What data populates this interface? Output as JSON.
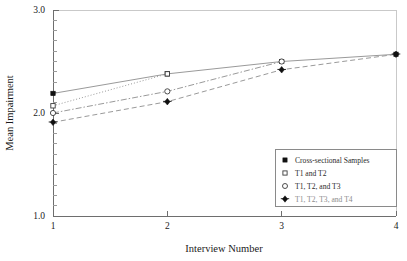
{
  "chart_data": {
    "type": "line",
    "title": "",
    "xlabel": "Interview Number",
    "ylabel": "Mean Impairment",
    "x": [
      1,
      2,
      3,
      4
    ],
    "xtick_labels": [
      "1",
      "2",
      "3",
      "4"
    ],
    "xlim": [
      1,
      4
    ],
    "ylim": [
      1.0,
      3.0
    ],
    "ytick_labels": [
      "3.0",
      "2.0",
      "1.0"
    ],
    "ytick_values": [
      3.0,
      2.0,
      1.0
    ],
    "yminor_step": 0.1,
    "grid": false,
    "legend_position": "lower right",
    "series": [
      {
        "name": "Cross-sectional Samples",
        "marker": "filled-square",
        "linestyle": "solid",
        "x": [
          1,
          2,
          3,
          4
        ],
        "values": [
          2.19,
          2.38,
          2.5,
          2.57
        ]
      },
      {
        "name": "T1 and T2",
        "marker": "open-square",
        "linestyle": "dotted",
        "x": [
          1,
          2
        ],
        "values": [
          2.07,
          2.38
        ]
      },
      {
        "name": "T1, T2, and T3",
        "marker": "open-circle",
        "linestyle": "dash-dot",
        "x": [
          1,
          2,
          3
        ],
        "values": [
          2.0,
          2.21,
          2.5
        ]
      },
      {
        "name": "T1, T2, T3, and T4",
        "marker": "filled-diamond",
        "linestyle": "dashed",
        "x": [
          1,
          2,
          3,
          4
        ],
        "values": [
          1.91,
          2.11,
          2.42,
          2.57
        ]
      }
    ]
  },
  "axes": {
    "y_title": "Mean Impairment",
    "x_title": "Interview Number",
    "y_ticks": [
      {
        "label": "3.0",
        "value": 3.0
      },
      {
        "label": "2.0",
        "value": 2.0
      },
      {
        "label": "1.0",
        "value": 1.0
      }
    ],
    "x_ticks": [
      {
        "label": "1",
        "value": 1
      },
      {
        "label": "2",
        "value": 2
      },
      {
        "label": "3",
        "value": 3
      },
      {
        "label": "4",
        "value": 4
      }
    ]
  },
  "legend": {
    "entries": [
      {
        "label": "Cross-sectional Samples",
        "marker": "filled-square"
      },
      {
        "label": "T1 and T2",
        "marker": "open-square"
      },
      {
        "label": "T1, T2, and T3",
        "marker": "open-circle"
      },
      {
        "label": "T1, T2, T3, and T4",
        "marker": "filled-diamond"
      }
    ]
  },
  "colors": {
    "marker": "#111111",
    "line": "#9a9a9a",
    "axis": "#6e6e6e",
    "frame": "#c9c9c9",
    "text": "#1a1a1a"
  }
}
